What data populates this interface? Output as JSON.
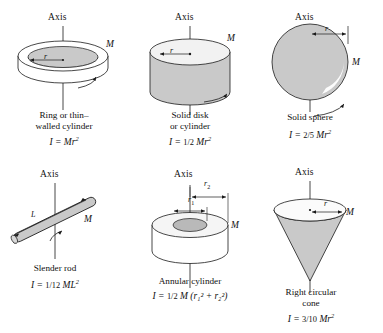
{
  "figure": {
    "background_color": "#ffffff",
    "ink_color": "#1a1a1a",
    "shape_fill": "#c9c9c9",
    "shape_fill_light": "#e8e8e8",
    "axis_label": "Axis",
    "mass_label": "M"
  },
  "items": [
    {
      "id": "ring",
      "name": "ring-or-thin-walled-cylinder",
      "axis_label": "Axis",
      "mass_label": "M",
      "dim_labels": [
        "r"
      ],
      "caption": "Ring or thin–\nwalled cylinder",
      "formula_prefix": "I  =  ",
      "formula_fraction": "",
      "formula_body": "Mr",
      "formula_exponent": "2",
      "formula_plain": "I = Mr²"
    },
    {
      "id": "disk",
      "name": "solid-disk-or-cylinder",
      "axis_label": "Axis",
      "mass_label": "M",
      "dim_labels": [
        "r"
      ],
      "caption": "Solid disk\nor cylinder",
      "formula_prefix": "I  =  ",
      "formula_fraction": "1/2",
      "formula_body": "Mr",
      "formula_exponent": "2",
      "formula_plain": "I = ½ Mr²"
    },
    {
      "id": "sphere",
      "name": "solid-sphere",
      "axis_label": "Axis",
      "mass_label": "M",
      "dim_labels": [
        "r"
      ],
      "caption": "Solid sphere",
      "formula_prefix": "I  =  ",
      "formula_fraction": "2/5",
      "formula_body": "Mr",
      "formula_exponent": "2",
      "formula_plain": "I = ⅖ Mr²"
    },
    {
      "id": "rod",
      "name": "slender-rod",
      "axis_label": "Axis",
      "mass_label": "M",
      "dim_labels": [
        "L"
      ],
      "caption": "Slender rod",
      "formula_prefix": "I  =  ",
      "formula_fraction": "1/12",
      "formula_body": "ML",
      "formula_exponent": "2",
      "formula_plain": "I = 1/12 ML²"
    },
    {
      "id": "annular",
      "name": "annular-cylinder",
      "axis_label": "Axis",
      "mass_label": "M",
      "dim_labels": [
        "r1",
        "r2"
      ],
      "caption": "Annular cylinder",
      "formula_prefix": "I  =  ",
      "formula_fraction": "1/2",
      "formula_body": "M (r₁² + r₂²)",
      "formula_exponent": "",
      "formula_plain": "I = ½ M (r₁² + r₂²)"
    },
    {
      "id": "cone",
      "name": "right-circular-cone",
      "axis_label": "Axis",
      "mass_label": "M",
      "dim_labels": [
        "r"
      ],
      "caption": "Right circular\ncone",
      "formula_prefix": "I  =  ",
      "formula_fraction": "3/10",
      "formula_body": "Mr",
      "formula_exponent": "2",
      "formula_plain": "I = 3/10 Mr²"
    }
  ]
}
